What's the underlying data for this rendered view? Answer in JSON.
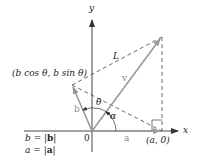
{
  "diagram": {
    "axes": {
      "x_label": "x",
      "y_label": "y",
      "origin_label": "0"
    },
    "points": {
      "origin": {
        "label": "0"
      },
      "a_point": {
        "label": "(a, 0)"
      },
      "b_point": {
        "label": "(b cos θ, b sin θ)"
      }
    },
    "vectors": {
      "a": {
        "label": "a",
        "color": "#9a9a9a"
      },
      "b": {
        "label": "b",
        "color": "#9a9a9a"
      },
      "v": {
        "label": "v",
        "color": "#9a9a9a"
      }
    },
    "segments": {
      "L": {
        "label": "L",
        "style": "dashed"
      }
    },
    "angles": {
      "theta": {
        "label": "θ"
      },
      "alpha": {
        "label": "α"
      }
    },
    "legend": {
      "line1": {
        "lhs": "b",
        "eq": " = |",
        "bold": "b",
        "end": "|"
      },
      "line2": {
        "lhs": "a",
        "eq": " = |",
        "bold": "a",
        "end": "|"
      }
    },
    "colors": {
      "axis": "#333333",
      "vector": "#9a9a9a",
      "dashed": "#444444"
    }
  }
}
